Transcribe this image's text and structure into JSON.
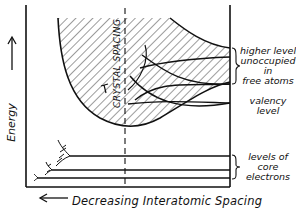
{
  "diagram": {
    "y_axis": {
      "label": "Energy",
      "arrow": "up-arrow-icon"
    },
    "x_axis": {
      "label": "Decreasing Interatomic Spacing",
      "arrow": "left-arrow-icon"
    },
    "marker": {
      "label": "CRYSTAL SPACING",
      "style": "dashed vertical line"
    },
    "annotations": [
      {
        "id": "higher",
        "lines": [
          "higher levels",
          "unoccupied",
          "in",
          "free atoms"
        ]
      },
      {
        "id": "valency",
        "lines": [
          "valency",
          "level"
        ]
      },
      {
        "id": "core",
        "lines": [
          "levels of",
          "core",
          "electrons"
        ]
      }
    ],
    "colors": {
      "ink": "#111111",
      "background": "#ffffff"
    }
  }
}
